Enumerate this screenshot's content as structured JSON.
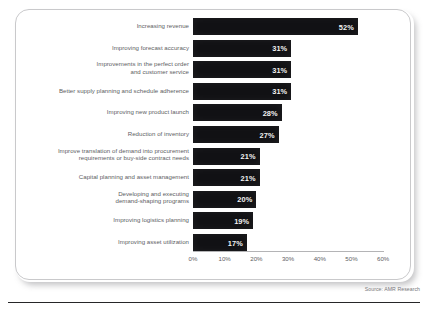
{
  "chart_data": {
    "type": "bar",
    "orientation": "horizontal",
    "title": "",
    "xlabel": "",
    "ylabel": "",
    "xlim": [
      0,
      60
    ],
    "grid": false,
    "legend": null,
    "tick_labels": [
      "0%",
      "10%",
      "20%",
      "30%",
      "40%",
      "50%",
      "60%"
    ],
    "tick_values": [
      0,
      10,
      20,
      30,
      40,
      50,
      60
    ],
    "categories": [
      "Increasing revenue",
      "Improving forecast accuracy",
      "Improvements in the perfect order and customer service",
      "Better supply planning and schedule adherence",
      "Improving new product launch",
      "Reduction of inventory",
      "Improve translation of demand into procurement requirements or buy-side contract needs",
      "Capital planning and asset management",
      "Developing and executing demand-shaping programs",
      "Improving logistics planning",
      "Improving asset utilization"
    ],
    "values": [
      52,
      31,
      31,
      31,
      28,
      27,
      21,
      21,
      20,
      19,
      17
    ],
    "data_labels": [
      "52%",
      "31%",
      "31%",
      "31%",
      "28%",
      "27%",
      "21%",
      "21%",
      "20%",
      "19%",
      "17%"
    ],
    "bar_color": "#111114",
    "label_color": "#f2f2f2"
  },
  "rows": [
    {
      "label_line1": "Increasing revenue",
      "label_line2": "",
      "value": 52,
      "data_label": "52%"
    },
    {
      "label_line1": "Improving forecast accuracy",
      "label_line2": "",
      "value": 31,
      "data_label": "31%"
    },
    {
      "label_line1": "Improvements in the perfect order",
      "label_line2": "and customer service",
      "value": 31,
      "data_label": "31%"
    },
    {
      "label_line1": "Better supply planning and schedule adherence",
      "label_line2": "",
      "value": 31,
      "data_label": "31%"
    },
    {
      "label_line1": "Improving new product launch",
      "label_line2": "",
      "value": 28,
      "data_label": "28%"
    },
    {
      "label_line1": "Reduction of inventory",
      "label_line2": "",
      "value": 27,
      "data_label": "27%"
    },
    {
      "label_line1": "Improve translation of demand into procurement",
      "label_line2": "requirements or buy-side contract needs",
      "value": 21,
      "data_label": "21%"
    },
    {
      "label_line1": "Capital planning and asset management",
      "label_line2": "",
      "value": 21,
      "data_label": "21%"
    },
    {
      "label_line1": "Developing and executing",
      "label_line2": "demand-shaping programs",
      "value": 20,
      "data_label": "20%"
    },
    {
      "label_line1": "Improving logistics planning",
      "label_line2": "",
      "value": 19,
      "data_label": "19%"
    },
    {
      "label_line1": "Improving asset utilization",
      "label_line2": "",
      "value": 17,
      "data_label": "17%"
    }
  ],
  "axis": {
    "ticks": [
      "0%",
      "10%",
      "20%",
      "30%",
      "40%",
      "50%",
      "60%"
    ]
  },
  "footer": {
    "source": "Source:  AMR Research"
  }
}
